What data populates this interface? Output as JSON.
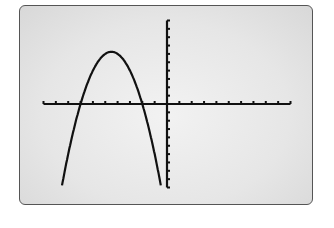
{
  "chart_data": {
    "type": "line",
    "title": "",
    "xlabel": "",
    "ylabel": "",
    "xlim": [
      -10,
      10
    ],
    "ylim": [
      -10,
      10
    ],
    "x_tick_step": 1,
    "y_tick_step": 1,
    "grid": false,
    "legend": null,
    "series": [
      {
        "name": "y = -(x+2)(x+7)",
        "function": "-(x+2)*(x+7)",
        "vertex": [
          -4.5,
          6.25
        ],
        "x_intercepts": [
          -7,
          -2
        ],
        "x": [
          -9.7,
          -9,
          -8,
          -7,
          -6,
          -5,
          -4.5,
          -4,
          -3,
          -2,
          -1,
          -0.3
        ],
        "y": [
          -20.7,
          -14,
          -6,
          0,
          4,
          6,
          6.25,
          6,
          4,
          0,
          -6,
          -10.9
        ]
      }
    ]
  },
  "screen": {
    "background": "#e8e8e8",
    "border_color": "#555555",
    "curve_color": "#111111",
    "axis_color": "#111111"
  }
}
